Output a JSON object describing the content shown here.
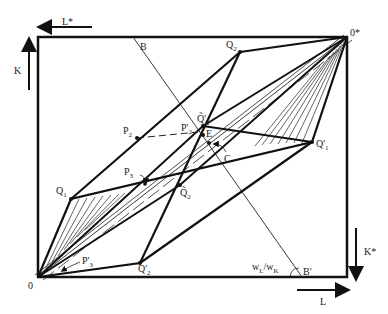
{
  "diagram": {
    "type": "edgeworth-box",
    "axes": {
      "top_left_arrow": "L*",
      "left_arrow": "K",
      "bottom_right_arrow": "L",
      "right_arrow": "K*"
    },
    "origins": {
      "O": "0",
      "O_star": "0*"
    },
    "points": {
      "B": "B",
      "B_prime": "B'",
      "Q1": {
        "main": "Q",
        "sub": "1"
      },
      "Q1_prime": {
        "main": "Q'",
        "sub": "1"
      },
      "Q2": {
        "main": "Q",
        "sub": "2"
      },
      "Q2_prime": {
        "main": "Q'",
        "sub": "2"
      },
      "Q2_tilde": {
        "main": "Q̃",
        "sub": "2"
      },
      "Q2_tilde_prime": {
        "main": "Q̃'",
        "sub": "2"
      },
      "P2": {
        "main": "P",
        "sub": "2"
      },
      "P2_prime": {
        "main": "P'",
        "sub": "2"
      },
      "P3": {
        "main": "P",
        "sub": "3"
      },
      "P3_prime": {
        "main": "P'",
        "sub": "3"
      },
      "E": "E",
      "C": "C"
    },
    "wage_ratio": {
      "w": "w",
      "L": "L",
      "slash": "/",
      "K": "K"
    }
  }
}
